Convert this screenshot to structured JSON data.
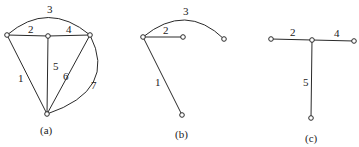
{
  "figures": [
    {
      "id": "a",
      "caption": "(a)",
      "nodes": [
        {
          "id": "A1",
          "x": 7,
          "y": 35
        },
        {
          "id": "A2",
          "x": 48,
          "y": 36
        },
        {
          "id": "A3",
          "x": 90,
          "y": 35
        },
        {
          "id": "A4",
          "x": 47,
          "y": 114
        }
      ],
      "edges": [
        {
          "label": "1",
          "from": "A1",
          "to": "A4",
          "type": "line"
        },
        {
          "label": "2",
          "from": "A1",
          "to": "A2",
          "type": "line"
        },
        {
          "label": "3",
          "from": "A1",
          "to": "A3",
          "type": "arc"
        },
        {
          "label": "4",
          "from": "A2",
          "to": "A3",
          "type": "line"
        },
        {
          "label": "5",
          "from": "A2",
          "to": "A4",
          "type": "line"
        },
        {
          "label": "6",
          "from": "A3",
          "to": "A4",
          "type": "line"
        },
        {
          "label": "7",
          "from": "A3",
          "to": "A4",
          "type": "arc"
        }
      ]
    },
    {
      "id": "b",
      "caption": "(b)",
      "nodes": [
        {
          "id": "B1",
          "x": 143,
          "y": 37
        },
        {
          "id": "B2",
          "x": 183,
          "y": 37
        },
        {
          "id": "B3",
          "x": 224,
          "y": 39
        },
        {
          "id": "B4",
          "x": 182,
          "y": 115
        }
      ],
      "edges": [
        {
          "label": "1",
          "from": "B1",
          "to": "B4",
          "type": "line"
        },
        {
          "label": "2",
          "from": "B1",
          "to": "B2",
          "type": "line"
        },
        {
          "label": "3",
          "from": "B1",
          "to": "B3",
          "type": "arc"
        }
      ]
    },
    {
      "id": "c",
      "caption": "(c)",
      "nodes": [
        {
          "id": "C1",
          "x": 271,
          "y": 39
        },
        {
          "id": "C2",
          "x": 312,
          "y": 40
        },
        {
          "id": "C3",
          "x": 354,
          "y": 41
        },
        {
          "id": "C4",
          "x": 311,
          "y": 118
        }
      ],
      "edges": [
        {
          "label": "2",
          "from": "C1",
          "to": "C2",
          "type": "line"
        },
        {
          "label": "4",
          "from": "C2",
          "to": "C3",
          "type": "line"
        },
        {
          "label": "5",
          "from": "C2",
          "to": "C4",
          "type": "line"
        }
      ]
    }
  ],
  "labels": {
    "a": {
      "e1": "1",
      "e2": "2",
      "e3": "3",
      "e4": "4",
      "e5": "5",
      "e6": "6",
      "e7": "7",
      "caption": "(a)"
    },
    "b": {
      "e1": "1",
      "e2": "2",
      "e3": "3",
      "caption": "(b)"
    },
    "c": {
      "e2": "2",
      "e4": "4",
      "e5": "5",
      "caption": "(c)"
    }
  }
}
